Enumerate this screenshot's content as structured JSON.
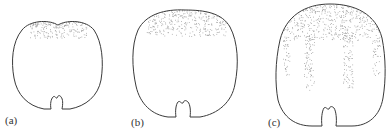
{
  "figure": {
    "panels": [
      {
        "id": "a",
        "label": "(a)",
        "stipple": "cap"
      },
      {
        "id": "b",
        "label": "(b)",
        "stipple": "cap"
      },
      {
        "id": "c",
        "label": "(c)",
        "stipple": "cap-and-streaks"
      }
    ],
    "colors": {
      "outline": "#3a3a3a",
      "stipple": "#9a9a9a",
      "background": "#ffffff"
    }
  }
}
